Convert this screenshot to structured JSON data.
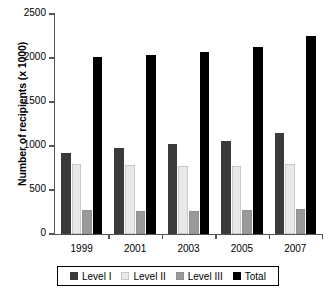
{
  "chart_data": {
    "type": "bar",
    "title": "",
    "xlabel": "",
    "ylabel": "Number of recipients (x 1000)",
    "categories": [
      "1999",
      "2001",
      "2003",
      "2005",
      "2007"
    ],
    "series": [
      {
        "name": "Level I",
        "color": "#3a3a3a",
        "values": [
          925,
          975,
          1020,
          1060,
          1150
        ]
      },
      {
        "name": "Level II",
        "color": "#e8e8e8",
        "values": [
          790,
          780,
          770,
          775,
          790
        ]
      },
      {
        "name": "Level III",
        "color": "#9a9a9a",
        "values": [
          270,
          265,
          265,
          270,
          285
        ]
      },
      {
        "name": "Total",
        "color": "#000000",
        "values": [
          2010,
          2035,
          2065,
          2125,
          2250
        ]
      }
    ],
    "ylim": [
      0,
      2500
    ],
    "yticks": [
      0,
      500,
      1000,
      1500,
      2000,
      2500
    ],
    "ytick_labels": [
      "0",
      "500",
      "1000",
      "1500",
      "2000",
      "2500"
    ],
    "grid": false,
    "legend_position": "bottom"
  }
}
